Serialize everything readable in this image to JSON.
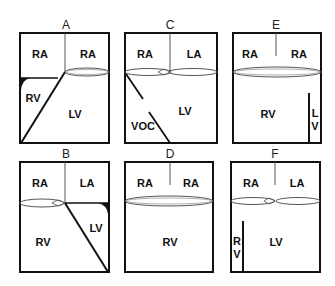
{
  "figure": {
    "colors": {
      "line": "#111111",
      "background": "#ffffff",
      "valve": "#555555"
    }
  },
  "panels": {
    "A": {
      "title": "A",
      "labels": {
        "tl": "RA",
        "tr": "LA",
        "mid": "RV",
        "main": "LV"
      }
    },
    "B": {
      "title": "B",
      "labels": {
        "tl": "RA",
        "tr": "LA",
        "mid": "LV",
        "main": "RV"
      }
    },
    "C": {
      "title": "C",
      "labels": {
        "tl": "RA",
        "tr": "LA",
        "mid": "VOC",
        "main": "LV"
      }
    },
    "D": {
      "title": "D",
      "labels": {
        "tl": "RA",
        "tr": "RA",
        "main": "RV"
      }
    },
    "E": {
      "title": "E",
      "labels": {
        "tl": "RA",
        "tr": "RA",
        "main": "RV",
        "side1": "L",
        "side2": "V"
      }
    },
    "F": {
      "title": "F",
      "labels": {
        "tl": "RA",
        "tr": "LA",
        "main": "LV",
        "side1": "R",
        "side2": "V"
      }
    }
  }
}
